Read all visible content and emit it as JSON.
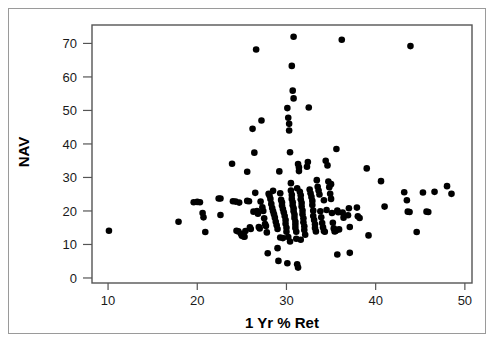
{
  "chart_data": {
    "type": "scatter",
    "title": "",
    "xlabel": "1 Yr % Ret",
    "ylabel": "NAV",
    "xlim": [
      8.2,
      50.8
    ],
    "ylim": [
      -1.5,
      75.5
    ],
    "xticks": [
      10,
      20,
      30,
      40,
      50
    ],
    "yticks": [
      0,
      10,
      20,
      30,
      40,
      50,
      60,
      70
    ],
    "grid": false,
    "legend": null,
    "marker": "filled-circle",
    "marker_color": "#000000",
    "n_points": 188,
    "points": [
      [
        10.1,
        14.1
      ],
      [
        17.9,
        16.8
      ],
      [
        19.6,
        22.6
      ],
      [
        20.0,
        22.7
      ],
      [
        20.3,
        22.6
      ],
      [
        20.6,
        19.4
      ],
      [
        20.7,
        18.1
      ],
      [
        20.9,
        13.7
      ],
      [
        22.4,
        23.7
      ],
      [
        22.6,
        23.7
      ],
      [
        22.6,
        18.8
      ],
      [
        23.9,
        34.1
      ],
      [
        24.0,
        22.9
      ],
      [
        24.3,
        22.8
      ],
      [
        24.4,
        14.1
      ],
      [
        24.6,
        13.9
      ],
      [
        24.9,
        13.2
      ],
      [
        25.0,
        12.6
      ],
      [
        25.1,
        13.1
      ],
      [
        25.2,
        12.4
      ],
      [
        25.3,
        12.3
      ],
      [
        25.6,
        31.7
      ],
      [
        25.6,
        23.0
      ],
      [
        25.8,
        22.9
      ],
      [
        25.9,
        15.1
      ],
      [
        26.0,
        14.6
      ],
      [
        26.2,
        44.5
      ],
      [
        26.4,
        37.4
      ],
      [
        26.5,
        25.4
      ],
      [
        26.6,
        68.2
      ],
      [
        26.7,
        20.0
      ],
      [
        26.8,
        19.2
      ],
      [
        26.9,
        15.2
      ],
      [
        27.0,
        14.8
      ],
      [
        27.2,
        47.0
      ],
      [
        27.3,
        21.1
      ],
      [
        27.4,
        20.0
      ],
      [
        27.5,
        17.8
      ],
      [
        27.6,
        16.1
      ],
      [
        27.7,
        15.5
      ],
      [
        27.8,
        13.6
      ],
      [
        27.9,
        7.4
      ],
      [
        28.1,
        24.6
      ],
      [
        28.2,
        23.6
      ],
      [
        28.3,
        22.1
      ],
      [
        28.4,
        20.9
      ],
      [
        28.5,
        19.9
      ],
      [
        28.6,
        19.0
      ],
      [
        28.7,
        18.0
      ],
      [
        28.8,
        16.8
      ],
      [
        28.9,
        15.7
      ],
      [
        29.0,
        14.6
      ],
      [
        29.0,
        8.9
      ],
      [
        29.1,
        5.1
      ],
      [
        29.2,
        31.8
      ],
      [
        29.3,
        25.3
      ],
      [
        29.4,
        23.3
      ],
      [
        29.5,
        22.5
      ],
      [
        29.5,
        21.6
      ],
      [
        29.6,
        20.6
      ],
      [
        29.7,
        19.6
      ],
      [
        29.8,
        18.5
      ],
      [
        29.9,
        17.3
      ],
      [
        29.9,
        16.2
      ],
      [
        30.0,
        15.0
      ],
      [
        30.0,
        13.8
      ],
      [
        30.1,
        4.4
      ],
      [
        30.1,
        50.7
      ],
      [
        30.2,
        47.8
      ],
      [
        30.3,
        46.0
      ],
      [
        30.3,
        44.0
      ],
      [
        30.4,
        37.5
      ],
      [
        30.5,
        28.3
      ],
      [
        30.5,
        26.1
      ],
      [
        30.6,
        24.8
      ],
      [
        30.6,
        23.6
      ],
      [
        30.7,
        22.6
      ],
      [
        30.7,
        21.7
      ],
      [
        30.8,
        20.8
      ],
      [
        30.8,
        19.9
      ],
      [
        30.9,
        18.9
      ],
      [
        30.9,
        17.9
      ],
      [
        31.0,
        16.8
      ],
      [
        31.0,
        15.9
      ],
      [
        31.0,
        14.9
      ],
      [
        31.1,
        13.8
      ],
      [
        31.1,
        11.7
      ],
      [
        30.8,
        72.0
      ],
      [
        30.6,
        63.3
      ],
      [
        30.7,
        55.9
      ],
      [
        30.8,
        53.6
      ],
      [
        31.2,
        4.1
      ],
      [
        31.3,
        3.1
      ],
      [
        31.3,
        34.0
      ],
      [
        31.4,
        33.0
      ],
      [
        31.4,
        31.9
      ],
      [
        31.5,
        25.7
      ],
      [
        31.6,
        24.7
      ],
      [
        31.6,
        23.5
      ],
      [
        31.7,
        22.4
      ],
      [
        31.7,
        21.3
      ],
      [
        31.8,
        20.1
      ],
      [
        31.8,
        19.0
      ],
      [
        31.9,
        17.8
      ],
      [
        31.9,
        16.6
      ],
      [
        32.0,
        15.4
      ],
      [
        32.0,
        14.3
      ],
      [
        32.3,
        33.2
      ],
      [
        32.4,
        34.6
      ],
      [
        32.5,
        50.9
      ],
      [
        32.6,
        26.4
      ],
      [
        32.7,
        25.3
      ],
      [
        32.8,
        24.2
      ],
      [
        32.9,
        23.0
      ],
      [
        32.9,
        21.8
      ],
      [
        33.0,
        20.1
      ],
      [
        33.0,
        18.5
      ],
      [
        33.1,
        17.3
      ],
      [
        33.2,
        16.0
      ],
      [
        33.2,
        14.9
      ],
      [
        33.3,
        13.9
      ],
      [
        33.5,
        27.2
      ],
      [
        33.6,
        26.1
      ],
      [
        33.7,
        24.9
      ],
      [
        33.8,
        19.9
      ],
      [
        33.9,
        18.1
      ],
      [
        34.0,
        16.4
      ],
      [
        34.1,
        15.1
      ],
      [
        34.2,
        14.0
      ],
      [
        34.3,
        13.8
      ],
      [
        34.4,
        35.0
      ],
      [
        34.6,
        33.6
      ],
      [
        34.7,
        28.8
      ],
      [
        34.8,
        27.1
      ],
      [
        34.9,
        25.1
      ],
      [
        35.0,
        23.6
      ],
      [
        35.1,
        19.4
      ],
      [
        35.2,
        16.5
      ],
      [
        35.3,
        14.8
      ],
      [
        35.4,
        13.9
      ],
      [
        35.5,
        14.0
      ],
      [
        35.6,
        14.3
      ],
      [
        35.6,
        38.5
      ],
      [
        35.7,
        20.1
      ],
      [
        35.8,
        19.6
      ],
      [
        35.9,
        14.5
      ],
      [
        35.7,
        7.0
      ],
      [
        36.2,
        71.1
      ],
      [
        36.3,
        19.5
      ],
      [
        36.4,
        18.0
      ],
      [
        36.9,
        18.7
      ],
      [
        37.0,
        20.8
      ],
      [
        37.1,
        15.2
      ],
      [
        37.1,
        7.5
      ],
      [
        37.9,
        21.0
      ],
      [
        38.0,
        18.4
      ],
      [
        38.2,
        17.9
      ],
      [
        39.0,
        32.7
      ],
      [
        39.2,
        12.7
      ],
      [
        40.6,
        28.9
      ],
      [
        41.0,
        21.3
      ],
      [
        43.2,
        25.6
      ],
      [
        43.5,
        23.2
      ],
      [
        43.6,
        19.8
      ],
      [
        43.8,
        19.7
      ],
      [
        43.9,
        69.2
      ],
      [
        44.6,
        13.7
      ],
      [
        45.3,
        25.5
      ],
      [
        45.7,
        19.8
      ],
      [
        45.9,
        19.7
      ],
      [
        46.6,
        25.7
      ],
      [
        48.0,
        27.4
      ],
      [
        48.5,
        25.1
      ],
      [
        29.3,
        12.1
      ],
      [
        29.6,
        11.9
      ],
      [
        30.2,
        12.2
      ],
      [
        32.1,
        12.9
      ],
      [
        28.0,
        25.1
      ],
      [
        28.5,
        26.0
      ],
      [
        31.2,
        26.8
      ],
      [
        33.4,
        29.2
      ],
      [
        30.4,
        10.9
      ],
      [
        31.6,
        11.4
      ],
      [
        34.5,
        20.3
      ],
      [
        26.3,
        19.8
      ],
      [
        27.1,
        22.8
      ],
      [
        35.0,
        28.0
      ],
      [
        34.2,
        23.2
      ],
      [
        25.4,
        14.0
      ],
      [
        24.7,
        22.5
      ]
    ]
  },
  "axis": {
    "y_title": "NAV",
    "x_title": "1 Yr % Ret",
    "y_tick_labels": [
      "0",
      "10",
      "20",
      "30",
      "40",
      "50",
      "60",
      "70"
    ],
    "x_tick_labels": [
      "10",
      "20",
      "30",
      "40",
      "50"
    ]
  },
  "colors": {
    "marker": "#000000",
    "plot_border": "#555555",
    "outer_border": "#9a9a9a",
    "background": "#ffffff",
    "text": "#1a1a1a"
  }
}
